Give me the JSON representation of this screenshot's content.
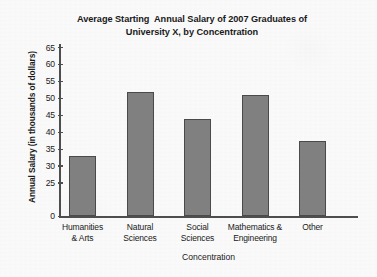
{
  "chart_data": {
    "type": "bar",
    "title": "Average Starting  Annual Salary of 2007 Graduates of\nUniversity X, by Concentration",
    "xlabel": "Concentration",
    "ylabel": "Annual Salary (in thousands of dollars)",
    "categories": [
      "Humanities\n& Arts",
      "Natural\nSciences",
      "Social\nSciences",
      "Mathematics &\nEngineering",
      "Other"
    ],
    "values": [
      33,
      52,
      44,
      51,
      37.5
    ],
    "ytick_labels": [
      "0",
      "25",
      "30",
      "35",
      "40",
      "45",
      "50",
      "55",
      "60",
      "65"
    ],
    "ytick_values": [
      0,
      25,
      30,
      35,
      40,
      45,
      50,
      55,
      60,
      65
    ],
    "ylim": [
      0,
      65
    ],
    "broken_axis": true,
    "grid": false,
    "legend": "none",
    "bar_color": "#808080",
    "bar_edge_color": "#4a4a4a",
    "axis_color": "#4e4e4e",
    "background_color": "#fbfbfb"
  }
}
